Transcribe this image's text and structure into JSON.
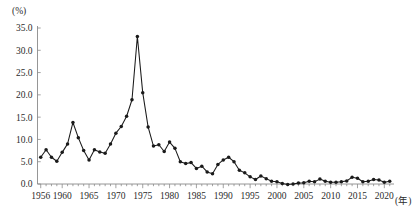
{
  "chart_data": {
    "type": "line",
    "title": "",
    "subtitle": "",
    "xlabel": "(年)",
    "ylabel": "(%)",
    "xlim": [
      1955.4,
      2021.8
    ],
    "ylim": [
      0.0,
      35.0
    ],
    "grid": false,
    "legend_position": "none",
    "marker": "filled-circle",
    "line_color": "#1a1a1a",
    "ytick_labels": [
      "0.0",
      "5.0",
      "10.0",
      "15.0",
      "20.0",
      "25.0",
      "30.0",
      "35.0"
    ],
    "ytick_values": [
      0.0,
      5.0,
      10.0,
      15.0,
      20.0,
      25.0,
      30.0,
      35.0
    ],
    "xtick_labels": [
      "1956",
      "1960",
      "1965",
      "1970",
      "1975",
      "1980",
      "1985",
      "1990",
      "1995",
      "2000",
      "2005",
      "2010",
      "2015",
      "2020"
    ],
    "xtick_values": [
      1956,
      1960,
      1965,
      1970,
      1975,
      1980,
      1985,
      1990,
      1995,
      2000,
      2005,
      2010,
      2015,
      2020
    ],
    "x": [
      1956,
      1957,
      1958,
      1959,
      1960,
      1961,
      1962,
      1963,
      1964,
      1965,
      1966,
      1967,
      1968,
      1969,
      1970,
      1971,
      1972,
      1973,
      1974,
      1975,
      1976,
      1977,
      1978,
      1979,
      1980,
      1981,
      1982,
      1983,
      1984,
      1985,
      1986,
      1987,
      1988,
      1989,
      1990,
      1991,
      1992,
      1993,
      1994,
      1995,
      1996,
      1997,
      1998,
      1999,
      2000,
      2001,
      2002,
      2003,
      2004,
      2005,
      2006,
      2007,
      2008,
      2009,
      2010,
      2011,
      2012,
      2013,
      2014,
      2015,
      2016,
      2017,
      2018,
      2019,
      2020,
      2021
    ],
    "series": [
      {
        "name": "消費者物価上昇率",
        "values": [
          6.0,
          7.7,
          6.0,
          5.1,
          7.1,
          9.0,
          13.8,
          10.4,
          7.5,
          5.4,
          7.7,
          7.2,
          6.9,
          9.0,
          11.4,
          12.9,
          15.2,
          18.9,
          33.1,
          20.5,
          12.8,
          8.5,
          8.8,
          7.3,
          9.4,
          8.0,
          5.0,
          4.6,
          4.8,
          3.5,
          4.0,
          2.7,
          2.3,
          4.4,
          5.4,
          6.0,
          5.0,
          3.1,
          2.5,
          1.6,
          1.0,
          1.8,
          1.2,
          0.6,
          0.5,
          0.1,
          -0.1,
          0.0,
          0.2,
          0.3,
          0.6,
          0.5,
          1.1,
          0.6,
          0.4,
          0.4,
          0.5,
          0.7,
          1.5,
          1.3,
          0.5,
          0.6,
          1.0,
          0.9,
          0.4,
          0.6
        ]
      }
    ]
  }
}
